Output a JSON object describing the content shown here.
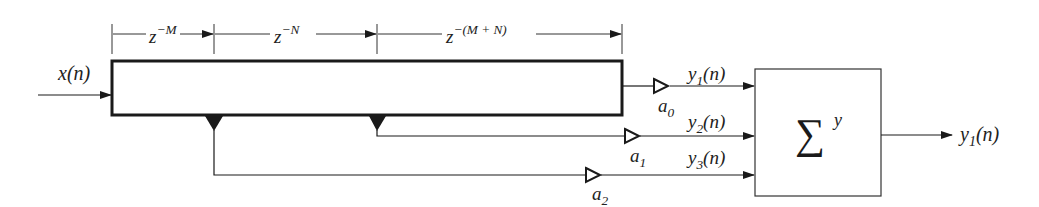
{
  "diagram": {
    "type": "tapped-delay-line-block-diagram",
    "input": {
      "label": "x(n)"
    },
    "delay_line": {
      "segments": [
        {
          "name": "z^-M",
          "base": "z",
          "exponent": "−M"
        },
        {
          "name": "z^-N",
          "base": "z",
          "exponent": "−N"
        },
        {
          "name": "z^-(M+N)",
          "base": "z",
          "exponent": "−(M + N)"
        }
      ]
    },
    "branches": [
      {
        "gain": "a",
        "gain_sub": "0",
        "signal": "y",
        "signal_sub": "1",
        "signal_suffix": "(n)"
      },
      {
        "gain": "a",
        "gain_sub": "1",
        "signal": "y",
        "signal_sub": "2",
        "signal_suffix": "(n)"
      },
      {
        "gain": "a",
        "gain_sub": "2",
        "signal": "y",
        "signal_sub": "3",
        "signal_suffix": "(n)"
      }
    ],
    "summer": {
      "symbol": "∑",
      "label": "y"
    },
    "output": {
      "signal": "y",
      "signal_sub": "1",
      "signal_suffix": "(n)"
    },
    "colors": {
      "stroke": "#1a1a1a",
      "background": "#ffffff"
    }
  }
}
